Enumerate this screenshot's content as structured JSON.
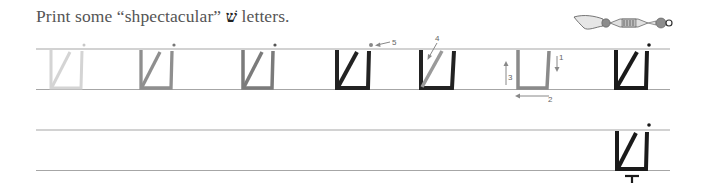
{
  "worksheet": {
    "instruction": {
      "before": "Print some “shpectacular” ",
      "letter": "שׁ",
      "after": " letters."
    },
    "decoration": "yad-torah-pointer",
    "rows": [
      {
        "id": "practice-row-1",
        "top_line_y": 49,
        "bottom_line_y": 89
      },
      {
        "id": "practice-row-2",
        "top_line_y": 130,
        "bottom_line_y": 170
      }
    ],
    "examples": [
      {
        "step": 1,
        "shade": "#d2d2d2",
        "x": 50
      },
      {
        "step": 2,
        "shade": "#9a9a9a",
        "x": 140
      },
      {
        "step": 3,
        "shade": "#7f7f7f",
        "x": 242
      },
      {
        "step": 4,
        "shade": "#222222",
        "x": 335
      },
      {
        "step": 5,
        "shade": "#222222",
        "x": 420,
        "highlight_stroke": "diagonal"
      },
      {
        "step": 6,
        "shade": "#8a8a8a",
        "x": 517,
        "outline_only": true
      },
      {
        "step": 7,
        "shade": "#1a1a1a",
        "x": 614
      }
    ],
    "stroke_labels": {
      "s1": "1",
      "s2": "2",
      "s3": "3",
      "s4": "4",
      "s5": "5"
    },
    "colors": {
      "rule_line": "#9a9a9a",
      "ink": "#1a1a1a",
      "arrow": "#888888"
    }
  }
}
